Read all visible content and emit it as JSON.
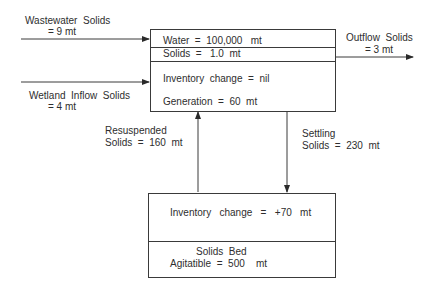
{
  "inputs": {
    "wastewater": {
      "label": "Wastewater  Solids",
      "value": "= 9 mt"
    },
    "wetland_inflow": {
      "label": "Wetland  Inflow  Solids",
      "value": "= 4 mt"
    }
  },
  "output": {
    "label": "Outflow  Solids",
    "value": "= 3 mt"
  },
  "water_column_box": {
    "water": "Water  =  100,000   mt",
    "solids": "Solids  =   1.0  mt",
    "inventory_change": "Inventory  change  =  nil",
    "generation": "Generation  =  60  mt"
  },
  "resuspension": {
    "line1": "Resuspended",
    "line2": "Solids  =  160  mt"
  },
  "settling": {
    "line1": "Settling",
    "line2": "Solids  =  230  mt"
  },
  "sediment_box": {
    "inventory_change": "Inventory   change   =   +70   mt",
    "title": "Solids  Bed",
    "agitatible": "Agitatible  =  500    mt"
  },
  "colors": {
    "line": "#3a3a3a",
    "text": "#2e2e2e",
    "background": "#ffffff"
  }
}
